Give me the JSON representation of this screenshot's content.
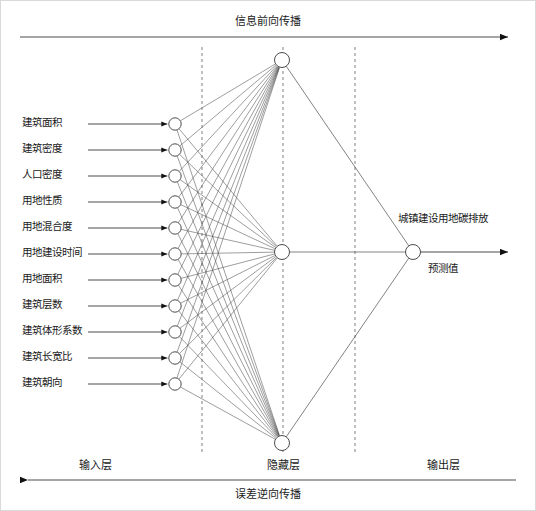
{
  "diagram": {
    "title_top": "信息前向传播",
    "title_bottom": "误差逆向传播",
    "layers": {
      "input_label": "输入层",
      "hidden_label": "隐藏层",
      "output_label": "输出层"
    },
    "input_nodes": [
      {
        "label": "建筑面积"
      },
      {
        "label": "建筑密度"
      },
      {
        "label": "人口密度"
      },
      {
        "label": "用地性质"
      },
      {
        "label": "用地混合度"
      },
      {
        "label": "用地建设时间"
      },
      {
        "label": "用地面积"
      },
      {
        "label": "建筑层数"
      },
      {
        "label": "建筑体形系数"
      },
      {
        "label": "建筑长宽比"
      },
      {
        "label": "建筑朝向"
      }
    ],
    "hidden_node_count": 3,
    "output": {
      "label_above": "城镇建设用地碳排放",
      "label_below": "预测值"
    },
    "colors": {
      "line": "#4d4d4d",
      "node_stroke": "#4d4d4d",
      "text": "#1a1a1a",
      "dashed": "#808080",
      "background": "#ffffff"
    }
  }
}
